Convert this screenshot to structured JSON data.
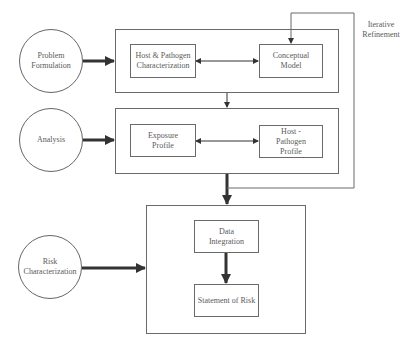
{
  "diagram": {
    "phases": [
      {
        "label": "Problem Formulation"
      },
      {
        "label": "Analysis"
      },
      {
        "label": "Risk Characterization"
      }
    ],
    "problem_formulation": {
      "host_pathogen_characterization": "Host & Pathogen Characterization",
      "conceptual_model": "Conceptual Model"
    },
    "analysis": {
      "exposure_profile": "Exposure Profile",
      "host_pathogen_profile": "Host - Pathogen Profile"
    },
    "risk_characterization": {
      "data_integration": "Data Integration",
      "statement_of_risk": "Statement of Risk"
    },
    "feedback_label": "Iterative Refinement",
    "colors": {
      "line": "#6a6a6a",
      "arrow": "#333333",
      "text": "#5a5a5a"
    }
  }
}
